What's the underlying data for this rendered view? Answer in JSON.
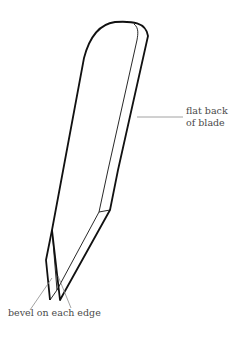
{
  "diagram": {
    "labels": {
      "flat_back": {
        "line1": "flat back",
        "line2": "of blade"
      },
      "bevel": {
        "text": "bevel on each edge"
      }
    },
    "colors": {
      "outline": "#111111",
      "leader": "#8a8a8a",
      "label_text": "#4a4a4a",
      "background": "#ffffff"
    }
  }
}
